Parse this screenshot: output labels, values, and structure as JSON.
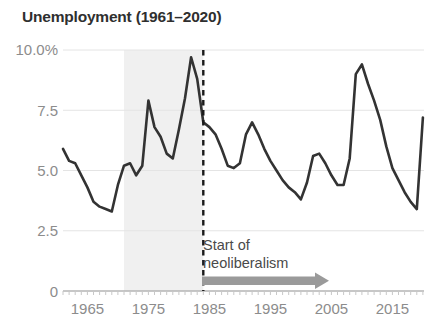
{
  "chart": {
    "title": "Unemployment (1961–2020)",
    "annotation_line1": "Start of",
    "annotation_line2": "neoliberalism"
  },
  "chart_data": {
    "type": "line",
    "title": "Unemployment (1961–2020)",
    "xlabel": "",
    "ylabel": "",
    "xlim": [
      1961,
      2020
    ],
    "ylim": [
      0,
      10
    ],
    "grid": true,
    "legend": null,
    "yticks": [
      0,
      2.5,
      5.0,
      7.5,
      10.0
    ],
    "ytick_labels": [
      "0",
      "2.5",
      "5.0",
      "7.5",
      "10.0%"
    ],
    "xticks": [
      1965,
      1975,
      1985,
      1995,
      2005,
      2015
    ],
    "xtick_labels": [
      "1965",
      "1975",
      "1985",
      "1995",
      "2005",
      "2015"
    ],
    "line_color": "#333333",
    "shaded_region": {
      "x0": 1971,
      "x1": 1984,
      "color": "#f0f0f0"
    },
    "marker_line": {
      "x": 1984,
      "style": "dashed",
      "color": "#1a1a1a"
    },
    "annotations": [
      {
        "text": "Start of neoliberalism",
        "x": 1985,
        "y": 2.0
      },
      {
        "type": "arrow",
        "x0": 1985,
        "x1": 2006,
        "y": 0.55,
        "color": "#9a9a9a"
      }
    ],
    "x": [
      1961,
      1962,
      1963,
      1964,
      1965,
      1966,
      1967,
      1968,
      1969,
      1970,
      1971,
      1972,
      1973,
      1974,
      1975,
      1976,
      1977,
      1978,
      1979,
      1980,
      1981,
      1982,
      1983,
      1984,
      1985,
      1986,
      1987,
      1988,
      1989,
      1990,
      1991,
      1992,
      1993,
      1994,
      1995,
      1996,
      1997,
      1998,
      1999,
      2000,
      2001,
      2002,
      2003,
      2004,
      2005,
      2006,
      2007,
      2008,
      2009,
      2010,
      2011,
      2012,
      2013,
      2014,
      2015,
      2016,
      2017,
      2018,
      2019,
      2020
    ],
    "values": [
      5.9,
      5.4,
      5.3,
      4.8,
      4.3,
      3.7,
      3.5,
      3.4,
      3.3,
      4.4,
      5.2,
      5.3,
      4.8,
      5.2,
      7.9,
      6.8,
      6.4,
      5.7,
      5.5,
      6.7,
      8.0,
      9.7,
      8.8,
      7.0,
      6.8,
      6.5,
      5.9,
      5.2,
      5.1,
      5.3,
      6.5,
      7.0,
      6.5,
      5.9,
      5.4,
      5.0,
      4.6,
      4.3,
      4.1,
      3.8,
      4.5,
      5.6,
      5.7,
      5.3,
      4.8,
      4.4,
      4.4,
      5.5,
      9.0,
      9.4,
      8.6,
      7.9,
      7.1,
      6.0,
      5.1,
      4.6,
      4.1,
      3.7,
      3.4,
      7.2
    ]
  }
}
